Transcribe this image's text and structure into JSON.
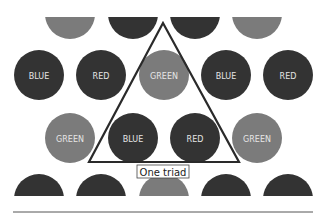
{
  "colors": {
    "dark": "#333333",
    "gray": "#7b7b7b",
    "text": "#e6e6e6",
    "line": "#2a2a2a"
  },
  "rows": [
    {
      "cy": 14,
      "clip_top": 17,
      "clip_bottom": null,
      "circles": [
        {
          "cx": 70,
          "tone": "gray",
          "label": ""
        },
        {
          "cx": 133,
          "tone": "dark",
          "label": ""
        },
        {
          "cx": 195,
          "tone": "dark",
          "label": ""
        },
        {
          "cx": 257,
          "tone": "gray",
          "label": ""
        }
      ]
    },
    {
      "cy": 75,
      "clip_top": null,
      "clip_bottom": null,
      "circles": [
        {
          "cx": 39,
          "tone": "dark",
          "label": "BLUE"
        },
        {
          "cx": 101,
          "tone": "dark",
          "label": "RED"
        },
        {
          "cx": 164,
          "tone": "gray",
          "label": "GREEN"
        },
        {
          "cx": 226,
          "tone": "dark",
          "label": "BLUE"
        },
        {
          "cx": 288,
          "tone": "dark",
          "label": "RED"
        }
      ]
    },
    {
      "cy": 138,
      "clip_top": null,
      "clip_bottom": null,
      "circles": [
        {
          "cx": 70,
          "tone": "gray",
          "label": "GREEN"
        },
        {
          "cx": 133,
          "tone": "dark",
          "label": "BLUE"
        },
        {
          "cx": 195,
          "tone": "dark",
          "label": "RED"
        },
        {
          "cx": 257,
          "tone": "gray",
          "label": "GREEN"
        }
      ]
    },
    {
      "cy": 199,
      "clip_top": null,
      "clip_bottom": 196,
      "circles": [
        {
          "cx": 39,
          "tone": "dark",
          "label": ""
        },
        {
          "cx": 101,
          "tone": "dark",
          "label": ""
        },
        {
          "cx": 164,
          "tone": "gray",
          "label": ""
        },
        {
          "cx": 226,
          "tone": "dark",
          "label": ""
        },
        {
          "cx": 288,
          "tone": "dark",
          "label": ""
        }
      ]
    }
  ],
  "radius": 25,
  "triangle": {
    "points": [
      [
        163,
        23
      ],
      [
        89,
        162
      ],
      [
        239,
        162
      ]
    ]
  },
  "caption": {
    "text": "One triad",
    "x": 137,
    "y": 165,
    "w": 52,
    "h": 13
  },
  "baseline": {
    "x1": 13,
    "x2": 313,
    "y": 212
  }
}
